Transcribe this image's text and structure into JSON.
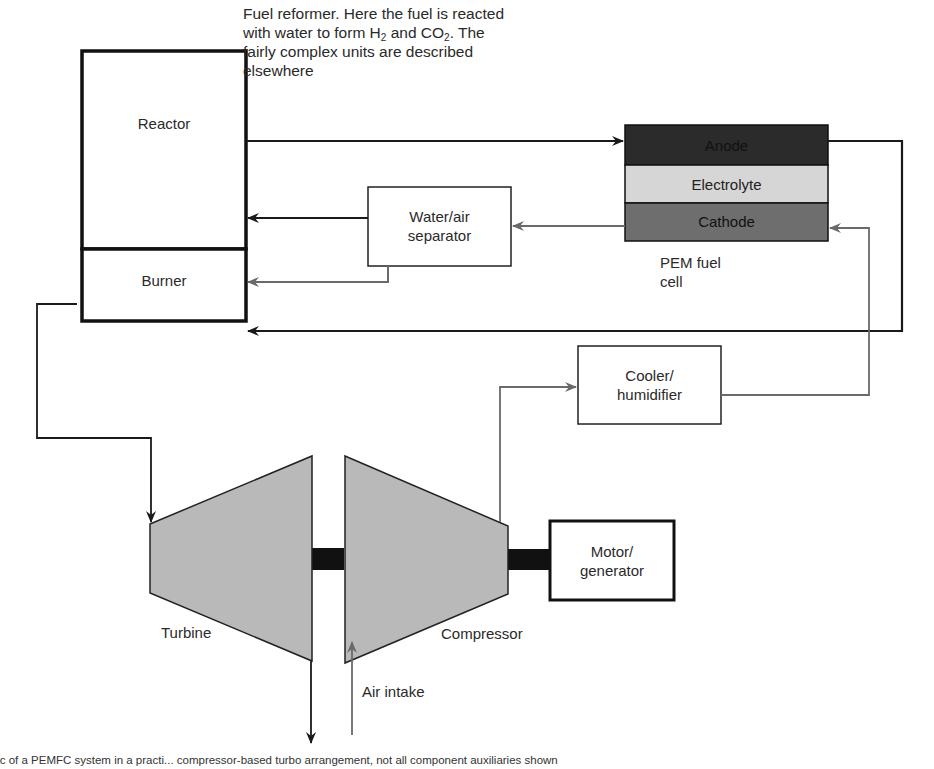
{
  "diagram": {
    "title_note": {
      "line1": "Fuel reformer. Here the fuel is reacted",
      "line2_pre": "with water to form H",
      "line2_sub1": "2",
      "line2_mid": " and CO",
      "line2_sub2": "2",
      "line2_post": ". The",
      "line3": "fairly complex units are described",
      "line4": "elsewhere"
    },
    "components": {
      "reactor": "Reactor",
      "burner": "Burner",
      "water_air_separator": {
        "line1": "Water/air",
        "line2": "separator"
      },
      "fuel_cell": {
        "anode": "Anode",
        "electrolyte": "Electrolyte",
        "cathode": "Cathode",
        "label_line1": "PEM fuel",
        "label_line2": "cell"
      },
      "cooler_humidifier": {
        "line1": "Cooler/",
        "line2": "humidifier"
      },
      "turbine": "Turbine",
      "compressor": "Compressor",
      "motor_generator": {
        "line1": "Motor/",
        "line2": "generator"
      },
      "air_intake": "Air intake"
    },
    "colors": {
      "anode": "#2b2b2b",
      "electrolyte": "#d6d6d6",
      "cathode": "#6e6e6e",
      "turbomachine_fill": "#b9b9b9",
      "black_flow": "#1a1a1a",
      "grey_flow": "#777777"
    }
  },
  "caption": "tic of a PEMFC system in a practi... compressor-based turbo arrangement, not all component auxiliaries shown"
}
